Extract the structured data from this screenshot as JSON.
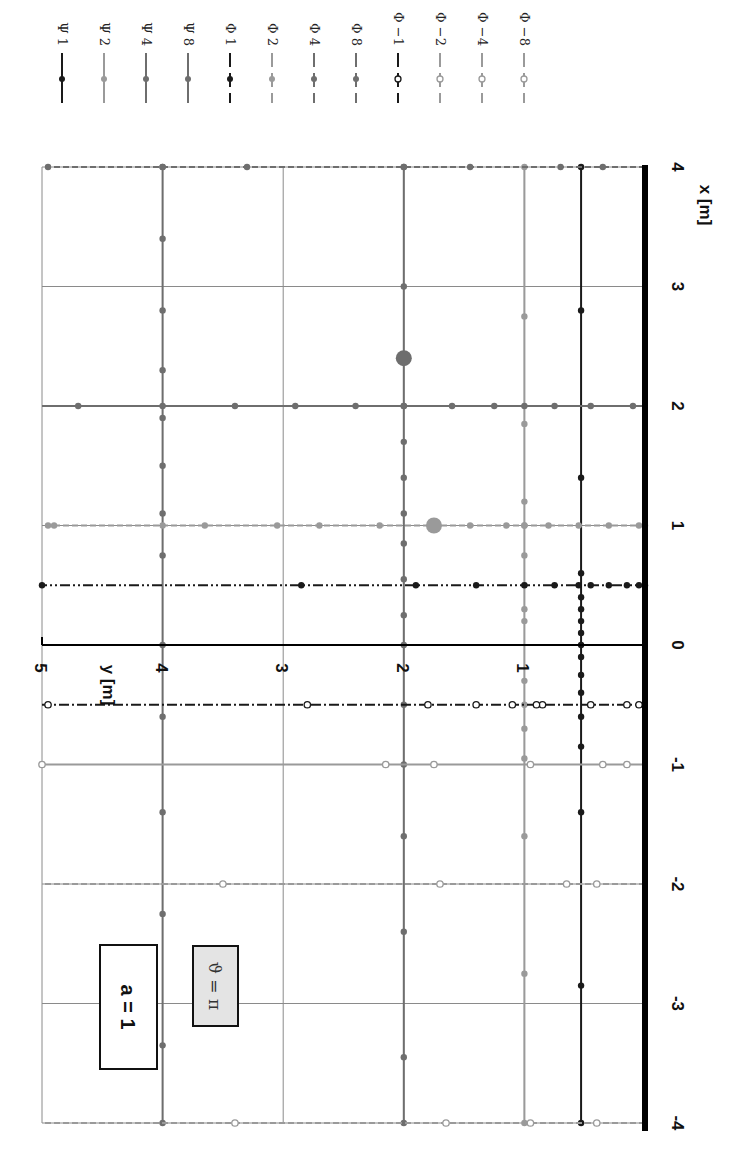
{
  "chart_data": {
    "type": "line",
    "orientation_note": "figure rotated 90 degrees clockwise",
    "title": "",
    "xlabel": "x [m]",
    "ylabel": "y [m]",
    "xlim": [
      -4,
      4
    ],
    "ylim": [
      0,
      5
    ],
    "x_ticks": [
      "-4",
      "-3",
      "-2",
      "-1",
      "0",
      "1",
      "2",
      "3",
      "4"
    ],
    "y_ticks": [
      "0",
      "1",
      "2",
      "3",
      "4",
      "5"
    ],
    "grid": true,
    "annotations": [
      "a = 1",
      "ϑ = π"
    ],
    "legend": [
      "Ψ 1",
      "Ψ 2",
      "Ψ 4",
      "Ψ 8",
      "Φ 1",
      "Φ 2",
      "Φ 4",
      "Φ 8",
      "Φ −1",
      "Φ −2",
      "Φ −4",
      "Φ −8"
    ],
    "legend_position": "top (right side of rotated figure)",
    "series": [
      {
        "name": "Ψ 1",
        "kind": "psi",
        "const_y": 0.53,
        "color": "#1a1a1a",
        "width": 2,
        "dash": "",
        "marker": "filled",
        "x": [
          -4,
          -2.85,
          -1.4,
          -0.85,
          -0.6,
          -0.4,
          -0.25,
          -0.1,
          0,
          0.1,
          0.2,
          0.3,
          0.4,
          0.6,
          1.4,
          2.8,
          4
        ]
      },
      {
        "name": "Ψ 2",
        "kind": "psi",
        "const_y": 1.0,
        "color": "#9a9a9a",
        "width": 2,
        "dash": "",
        "marker": "filled",
        "x": [
          -4,
          -2.75,
          -1.6,
          -0.95,
          -0.7,
          -0.5,
          -0.3,
          0.2,
          0.3,
          0.5,
          0.75,
          1.0,
          1.2,
          1.85,
          2.75,
          4
        ]
      },
      {
        "name": "Ψ 4",
        "kind": "psi",
        "const_y": 2.0,
        "color": "#6e6e6e",
        "width": 2,
        "dash": "",
        "marker": "filled",
        "x": [
          -4,
          -3.45,
          -2.4,
          -1.6,
          -1.0,
          -0.5,
          0,
          0.25,
          0.55,
          0.85,
          1.1,
          1.4,
          1.7,
          2.0,
          3.0,
          4
        ]
      },
      {
        "name": "Ψ 8",
        "kind": "psi",
        "const_y": 4.0,
        "color": "#6e6e6e",
        "width": 2,
        "dash": "",
        "marker": "filled",
        "x": [
          -4,
          -3.35,
          -2.25,
          -1.4,
          -0.6,
          0,
          0.75,
          1.1,
          1.5,
          1.9,
          2.3,
          2.8,
          3.4,
          4
        ]
      },
      {
        "name": "Φ 1",
        "kind": "phi",
        "const_x": 0.5,
        "color": "#1a1a1a",
        "width": 2,
        "dash": "10 3 2 3 2 3",
        "marker": "filled",
        "y": [
          0,
          0.05,
          0.15,
          0.3,
          0.45,
          0.55,
          0.75,
          1.0,
          1.4,
          1.9,
          2.85,
          5
        ]
      },
      {
        "name": "Φ 2",
        "kind": "phi",
        "const_x": 1.0,
        "color": "#9a9a9a",
        "width": 2,
        "dash": "6 3",
        "marker": "filled",
        "y": [
          0,
          0.05,
          0.3,
          0.55,
          0.8,
          1.0,
          1.15,
          1.45,
          1.75,
          2.2,
          2.7,
          3.05,
          3.65,
          4.0,
          4.9,
          4.95
        ]
      },
      {
        "name": "Φ 4",
        "kind": "phi",
        "const_x": 2.0,
        "color": "#6e6e6e",
        "width": 2,
        "dash": "",
        "marker": "filled",
        "y": [
          0.1,
          0.45,
          0.75,
          1.0,
          1.25,
          1.6,
          2.0,
          2.4,
          2.9,
          3.4,
          4.0,
          4.7
        ]
      },
      {
        "name": "Φ 8",
        "kind": "phi",
        "const_x": 4.0,
        "color": "#6e6e6e",
        "width": 2,
        "dash": "6 3",
        "marker": "filled",
        "y": [
          0.35,
          0.7,
          1.45,
          2.0,
          3.3,
          4.0,
          4.95
        ]
      },
      {
        "name": "Φ −1",
        "kind": "phi",
        "const_x": -0.5,
        "color": "#1a1a1a",
        "width": 2,
        "dash": "10 3 2 3",
        "marker": "open",
        "y": [
          0.05,
          0.15,
          0.45,
          0.85,
          0.9,
          1.1,
          1.4,
          1.8,
          2.8,
          4.95
        ]
      },
      {
        "name": "Φ −2",
        "kind": "phi",
        "const_x": -1.0,
        "color": "#9a9a9a",
        "width": 2,
        "dash": "",
        "marker": "open",
        "y": [
          0.15,
          0.35,
          0.95,
          1.75,
          2.15,
          5.0
        ]
      },
      {
        "name": "Φ −4",
        "kind": "phi",
        "const_x": -2.0,
        "color": "#9a9a9a",
        "width": 2,
        "dash": "6 3",
        "marker": "open",
        "y": [
          0.4,
          0.65,
          1.7,
          3.5
        ]
      },
      {
        "name": "Φ −8",
        "kind": "phi",
        "const_x": -4.0,
        "color": "#9a9a9a",
        "width": 2,
        "dash": "6 3",
        "marker": "open",
        "y": [
          0.4,
          0.95,
          1.65,
          3.4
        ]
      }
    ],
    "highlight_points": [
      {
        "x": 1.0,
        "y": 1.75,
        "color": "#9a9a9a",
        "r": 8
      },
      {
        "x": 2.4,
        "y": 2.0,
        "color": "#6e6e6e",
        "r": 8
      }
    ]
  },
  "labels": {
    "x_axis": "x [m]",
    "y_axis": "y [m]",
    "box_a": "a = 1",
    "box_theta": "ϑ = π"
  }
}
